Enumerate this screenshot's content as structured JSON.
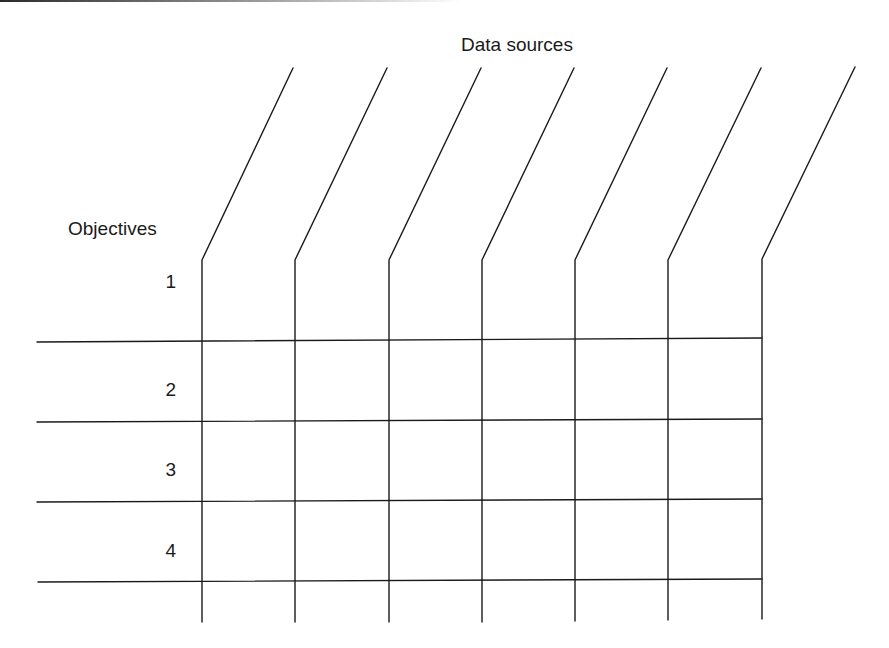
{
  "diagram": {
    "column_header": "Data sources",
    "row_header": "Objectives",
    "rows": [
      {
        "label": "1",
        "top": 272
      },
      {
        "label": "2",
        "top": 380
      },
      {
        "label": "3",
        "top": 460
      },
      {
        "label": "4",
        "top": 541
      }
    ],
    "column_count": 7,
    "line_color": "#1a1a1a"
  }
}
